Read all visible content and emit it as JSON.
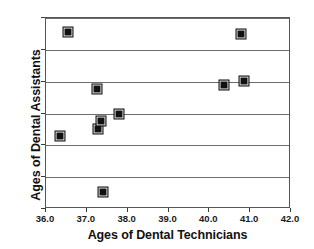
{
  "chart_data": {
    "type": "scatter",
    "title": "",
    "xlabel": "Ages of Dental Technicians",
    "ylabel": "Ages of Dental Assistants",
    "xlim": [
      36.0,
      42.0
    ],
    "ylim": [
      30.0,
      36.0
    ],
    "xticks": [
      "36.0",
      "37.0",
      "38.0",
      "39.0",
      "40.0",
      "41.0",
      "42.0"
    ],
    "yticks": [
      "30.0",
      "31.0",
      "32.0",
      "33.0",
      "34.0",
      "35.0",
      "36.0"
    ],
    "xtick_values": [
      36.0,
      37.0,
      38.0,
      39.0,
      40.0,
      41.0,
      42.0
    ],
    "ytick_values": [
      30.0,
      31.0,
      32.0,
      33.0,
      34.0,
      35.0,
      36.0
    ],
    "grid": "horizontal",
    "legend": "none",
    "marker": "filled-square",
    "marker_color": "#111111",
    "points": [
      {
        "x": 36.35,
        "y": 32.3
      },
      {
        "x": 36.55,
        "y": 35.57
      },
      {
        "x": 37.25,
        "y": 33.77
      },
      {
        "x": 37.28,
        "y": 32.5
      },
      {
        "x": 37.35,
        "y": 32.78
      },
      {
        "x": 37.4,
        "y": 30.52
      },
      {
        "x": 37.78,
        "y": 33.0
      },
      {
        "x": 40.35,
        "y": 33.9
      },
      {
        "x": 40.78,
        "y": 35.5
      },
      {
        "x": 40.85,
        "y": 34.02
      }
    ]
  },
  "figure": {
    "cut_off_header": "",
    "background": "#ffffff",
    "frame_color": "#555555",
    "gridline_color": "#6d6d6d"
  }
}
